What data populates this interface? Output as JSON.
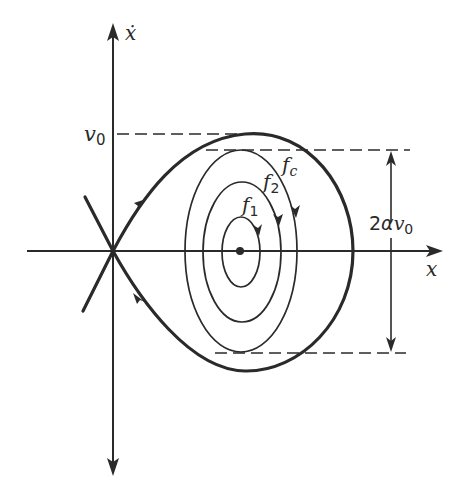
{
  "figure": {
    "type": "phase-plane portrait",
    "axes": {
      "x_label": "x",
      "y_label": "ẋ"
    },
    "labels": {
      "v0": "v",
      "v0_sub": "0",
      "f1": "f",
      "f1_sub": "1",
      "f2": "f",
      "f2_sub": "2",
      "fc": "f",
      "fc_sub": "c",
      "amplitude_prefix": "2",
      "amplitude_alpha": "α",
      "amplitude_v": "v",
      "amplitude_sub": "0"
    },
    "elements": {
      "saddle_point": "origin, with crossing separatrix lines",
      "center_point": "equilibrium dot on x-axis",
      "closed_orbits": [
        "f1",
        "f2",
        "fc"
      ],
      "separatrix": "thick homoclinic loop through origin reaching max ẋ = v0",
      "dimension": "2αv0 between dashed horizontal lines at top and bottom of fc"
    },
    "colors": {
      "ink": "#2a2a2a",
      "background": "#ffffff"
    }
  }
}
